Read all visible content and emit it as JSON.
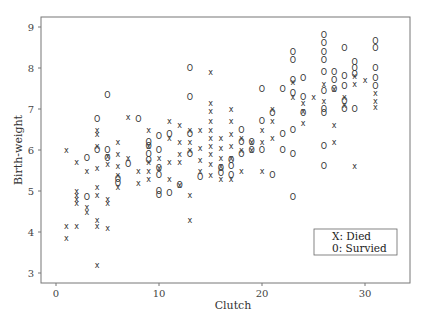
{
  "chart_data": {
    "type": "scatter",
    "title": "",
    "xlabel": "Clutch",
    "ylabel": "Birth-weight",
    "xlim": [
      -1.5,
      34
    ],
    "ylim": [
      2.75,
      9.25
    ],
    "x_ticks": [
      0,
      10,
      20,
      30
    ],
    "y_ticks": [
      3,
      4,
      5,
      6,
      7,
      8,
      9
    ],
    "grid": false,
    "legend": {
      "position": "lower right",
      "entries": [
        "X: Died",
        "0: Survied"
      ]
    },
    "series": [
      {
        "name": "Died",
        "marker": "X",
        "points": [
          [
            1,
            6.0
          ],
          [
            1,
            4.15
          ],
          [
            1,
            3.85
          ],
          [
            2,
            5.7
          ],
          [
            2,
            5.0
          ],
          [
            2,
            4.9
          ],
          [
            2,
            4.8
          ],
          [
            2,
            4.7
          ],
          [
            2,
            4.15
          ],
          [
            3,
            5.5
          ],
          [
            3,
            4.6
          ],
          [
            3,
            4.5
          ],
          [
            4,
            6.5
          ],
          [
            4,
            6.4
          ],
          [
            4,
            6.1
          ],
          [
            4,
            5.55
          ],
          [
            4,
            5.1
          ],
          [
            4,
            4.9
          ],
          [
            4,
            4.3
          ],
          [
            4,
            4.15
          ],
          [
            4,
            3.2
          ],
          [
            5,
            5.85
          ],
          [
            5,
            5.65
          ],
          [
            5,
            4.8
          ],
          [
            5,
            4.7
          ],
          [
            5,
            4.1
          ],
          [
            6,
            6.2
          ],
          [
            6,
            5.9
          ],
          [
            6,
            5.6
          ],
          [
            6,
            5.4
          ],
          [
            6,
            5.1
          ],
          [
            7,
            6.8
          ],
          [
            7,
            5.8
          ],
          [
            8,
            5.5
          ],
          [
            8,
            5.2
          ],
          [
            9,
            6.5
          ],
          [
            9,
            6.1
          ],
          [
            9,
            5.7
          ],
          [
            9,
            5.5
          ],
          [
            9,
            5.3
          ],
          [
            10,
            5.8
          ],
          [
            10,
            5.55
          ],
          [
            11,
            6.7
          ],
          [
            11,
            6.3
          ],
          [
            11,
            5.7
          ],
          [
            11,
            5.3
          ],
          [
            12,
            6.6
          ],
          [
            12,
            6.2
          ],
          [
            12,
            5.9
          ],
          [
            12,
            5.7
          ],
          [
            12,
            5.15
          ],
          [
            13,
            6.5
          ],
          [
            13,
            6.2
          ],
          [
            13,
            6.0
          ],
          [
            13,
            4.9
          ],
          [
            13,
            4.3
          ],
          [
            14,
            6.5
          ],
          [
            14,
            6.05
          ],
          [
            14,
            5.75
          ],
          [
            14,
            5.5
          ],
          [
            15,
            7.9
          ],
          [
            15,
            7.15
          ],
          [
            15,
            6.95
          ],
          [
            15,
            6.7
          ],
          [
            15,
            6.5
          ],
          [
            15,
            6.3
          ],
          [
            15,
            6.1
          ],
          [
            15,
            5.9
          ],
          [
            15,
            5.65
          ],
          [
            15,
            5.4
          ],
          [
            16,
            6.3
          ],
          [
            16,
            6.05
          ],
          [
            16,
            5.8
          ],
          [
            16,
            5.6
          ],
          [
            16,
            5.3
          ],
          [
            17,
            7.0
          ],
          [
            17,
            6.7
          ],
          [
            17,
            6.4
          ],
          [
            17,
            6.1
          ],
          [
            17,
            5.8
          ],
          [
            17,
            5.3
          ],
          [
            18,
            6.3
          ],
          [
            18,
            6.0
          ],
          [
            18,
            5.5
          ],
          [
            19,
            6.2
          ],
          [
            19,
            6.0
          ],
          [
            20,
            6.5
          ],
          [
            20,
            6.2
          ],
          [
            20,
            5.5
          ],
          [
            21,
            7.0
          ],
          [
            21,
            6.7
          ],
          [
            21,
            6.3
          ],
          [
            23,
            7.65
          ],
          [
            23,
            7.3
          ],
          [
            24,
            7.15
          ],
          [
            24,
            6.95
          ],
          [
            24,
            6.65
          ],
          [
            25,
            7.3
          ],
          [
            26,
            7.6
          ],
          [
            26,
            7.2
          ],
          [
            27,
            7.5
          ],
          [
            27,
            6.6
          ],
          [
            27,
            6.2
          ],
          [
            28,
            7.1
          ],
          [
            28,
            7.3
          ],
          [
            29,
            7.8
          ],
          [
            29,
            7.6
          ],
          [
            29,
            5.6
          ],
          [
            30,
            7.7
          ],
          [
            31,
            7.4
          ],
          [
            31,
            7.2
          ],
          [
            31,
            7.05
          ]
        ]
      },
      {
        "name": "Survied",
        "marker": "0",
        "points": [
          [
            3,
            4.85
          ],
          [
            3,
            5.8
          ],
          [
            4,
            6.75
          ],
          [
            4,
            6.0
          ],
          [
            5,
            7.35
          ],
          [
            5,
            6.0
          ],
          [
            5,
            5.8
          ],
          [
            6,
            5.3
          ],
          [
            6,
            5.2
          ],
          [
            7,
            5.65
          ],
          [
            8,
            6.75
          ],
          [
            9,
            6.2
          ],
          [
            9,
            6.1
          ],
          [
            9,
            5.9
          ],
          [
            9,
            5.75
          ],
          [
            10,
            6.35
          ],
          [
            10,
            6.0
          ],
          [
            10,
            5.55
          ],
          [
            10,
            5.4
          ],
          [
            10,
            5.0
          ],
          [
            10,
            4.9
          ],
          [
            11,
            4.95
          ],
          [
            11,
            6.4
          ],
          [
            12,
            5.15
          ],
          [
            13,
            8.0
          ],
          [
            13,
            7.3
          ],
          [
            13,
            6.4
          ],
          [
            13,
            5.9
          ],
          [
            14,
            5.35
          ],
          [
            16,
            5.55
          ],
          [
            16,
            5.45
          ],
          [
            17,
            5.75
          ],
          [
            17,
            5.6
          ],
          [
            17,
            5.4
          ],
          [
            18,
            6.5
          ],
          [
            18,
            6.2
          ],
          [
            18,
            5.9
          ],
          [
            19,
            6.2
          ],
          [
            19,
            6.0
          ],
          [
            20,
            7.5
          ],
          [
            20,
            6.7
          ],
          [
            20,
            6.0
          ],
          [
            21,
            5.4
          ],
          [
            21,
            6.9
          ],
          [
            22,
            6.4
          ],
          [
            22,
            6.0
          ],
          [
            22,
            7.5
          ],
          [
            23,
            8.4
          ],
          [
            23,
            8.2
          ],
          [
            23,
            7.7
          ],
          [
            23,
            7.4
          ],
          [
            23,
            6.5
          ],
          [
            23,
            5.9
          ],
          [
            23,
            4.85
          ],
          [
            24,
            7.75
          ],
          [
            24,
            7.3
          ],
          [
            24,
            6.9
          ],
          [
            26,
            8.8
          ],
          [
            26,
            8.6
          ],
          [
            26,
            8.4
          ],
          [
            26,
            8.2
          ],
          [
            26,
            7.9
          ],
          [
            26,
            7.45
          ],
          [
            26,
            7.0
          ],
          [
            26,
            6.9
          ],
          [
            26,
            6.1
          ],
          [
            26,
            5.6
          ],
          [
            27,
            7.9
          ],
          [
            27,
            7.7
          ],
          [
            27,
            7.5
          ],
          [
            28,
            8.5
          ],
          [
            28,
            7.8
          ],
          [
            28,
            7.55
          ],
          [
            28,
            7.2
          ],
          [
            28,
            7.0
          ],
          [
            29,
            8.15
          ],
          [
            29,
            8.0
          ],
          [
            29,
            7.85
          ],
          [
            29,
            7.0
          ],
          [
            31,
            8.65
          ],
          [
            31,
            8.5
          ],
          [
            31,
            8.0
          ],
          [
            31,
            7.75
          ],
          [
            31,
            7.55
          ]
        ]
      }
    ]
  }
}
